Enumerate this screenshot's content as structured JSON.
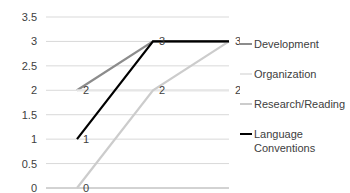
{
  "chart_data": {
    "type": "line",
    "title": "",
    "xlabel": "",
    "ylabel": "",
    "categories": [
      "September",
      "October",
      "November"
    ],
    "ylim": [
      0,
      3.5
    ],
    "yticks": [
      "0",
      "0.5",
      "1",
      "1.5",
      "2",
      "2.5",
      "3",
      "3.5"
    ],
    "grid": true,
    "legend_position": "right",
    "series": [
      {
        "name": "Development",
        "values": [
          2,
          3,
          3
        ],
        "color": "#8c8c8c",
        "show_labels": [
          true,
          false,
          false
        ]
      },
      {
        "name": "Organization",
        "values": [
          2,
          2,
          2
        ],
        "color": "#e6e6e6",
        "show_labels": [
          false,
          true,
          true
        ]
      },
      {
        "name": "Research/Reading",
        "values": [
          0,
          2,
          3
        ],
        "color": "#cccccc",
        "show_labels": [
          true,
          false,
          true
        ]
      },
      {
        "name": "Language Conventions",
        "values": [
          1,
          3,
          3
        ],
        "color": "#000000",
        "show_labels": [
          true,
          true,
          false
        ]
      }
    ]
  },
  "legend": {
    "items": [
      {
        "label": "Development",
        "color": "#8c8c8c"
      },
      {
        "label": "Organization",
        "color": "#e6e6e6"
      },
      {
        "label": "Research/Reading",
        "color": "#cccccc"
      },
      {
        "label": "Language Conventions",
        "color": "#000000"
      }
    ]
  }
}
